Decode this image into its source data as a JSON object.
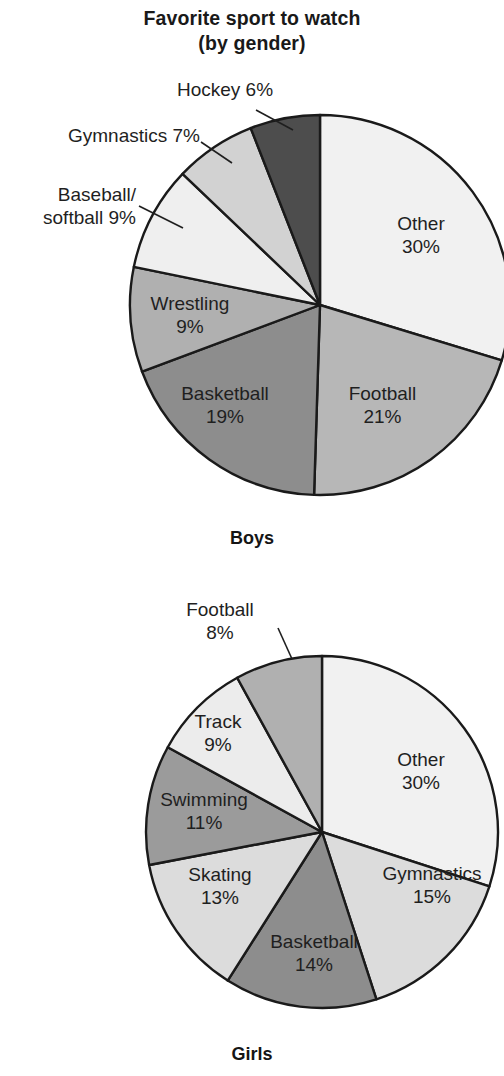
{
  "title": {
    "line1": "Favorite sport to watch",
    "line2": "(by gender)"
  },
  "captions": {
    "boys": "Boys",
    "girls": "Girls"
  },
  "boys_labels": {
    "hockey": "Hockey 6%",
    "gymnastics": "Gymnastics 7%",
    "baseball_l1": "Baseball/",
    "baseball_l2": "softball 9%",
    "wrestling_name": "Wrestling",
    "wrestling_pct": "9%",
    "basketball_name": "Basketball",
    "basketball_pct": "19%",
    "football_name": "Football",
    "football_pct": "21%",
    "other_name": "Other",
    "other_pct": "30%"
  },
  "girls_labels": {
    "football_l1": "Football",
    "football_l2": "8%",
    "track_name": "Track",
    "track_pct": "9%",
    "swimming_name": "Swimming",
    "swimming_pct": "11%",
    "skating_name": "Skating",
    "skating_pct": "13%",
    "basketball_name": "Basketball",
    "basketball_pct": "14%",
    "gymnastics_name": "Gymnastics",
    "gymnastics_pct": "15%",
    "other_name": "Other",
    "other_pct": "30%"
  },
  "colors": {
    "outline": "#1a1a1a",
    "text": "#1f1f1f",
    "background": "#ffffff",
    "very_light": "#f1f1f1",
    "light": "#e4e4e4",
    "light_mid": "#d2d2d2",
    "mid": "#b7b7b7",
    "mid_dark": "#9b9b9b",
    "dark": "#8d8d8d",
    "darkest": "#4d4d4d"
  },
  "chart_data": [
    {
      "type": "pie",
      "title": "Favorite sport to watch (by gender)",
      "subtitle": "Boys",
      "start_angle_deg": 0,
      "direction": "clockwise",
      "center": [
        320,
        305
      ],
      "radius": 190,
      "units": "percent",
      "labels": [
        "Other",
        "Football",
        "Basketball",
        "Wrestling",
        "Baseball/softball",
        "Gymnastics",
        "Hockey"
      ],
      "values": [
        30,
        21,
        19,
        9,
        9,
        7,
        6
      ],
      "slice_colors": [
        "#f1f1f1",
        "#b7b7b7",
        "#8d8d8d",
        "#b0b0b0",
        "#efefef",
        "#d2d2d2",
        "#4d4d4d"
      ],
      "label_placement": [
        "inside",
        "inside",
        "inside",
        "inside",
        "outside",
        "outside",
        "outside"
      ],
      "legend": "none",
      "grid": false
    },
    {
      "type": "pie",
      "title": "Favorite sport to watch (by gender)",
      "subtitle": "Girls",
      "start_angle_deg": 0,
      "direction": "clockwise",
      "center": [
        322,
        832
      ],
      "radius": 176,
      "units": "percent",
      "labels": [
        "Other",
        "Gymnastics",
        "Basketball",
        "Skating",
        "Swimming",
        "Track",
        "Football"
      ],
      "values": [
        30,
        15,
        14,
        13,
        11,
        9,
        8
      ],
      "slice_colors": [
        "#f1f1f1",
        "#dcdcdc",
        "#8d8d8d",
        "#dcdcdc",
        "#9b9b9b",
        "#ececec",
        "#b0b0b0"
      ],
      "label_placement": [
        "inside",
        "inside",
        "inside",
        "inside",
        "inside",
        "inside",
        "outside"
      ],
      "legend": "none",
      "grid": false
    }
  ]
}
